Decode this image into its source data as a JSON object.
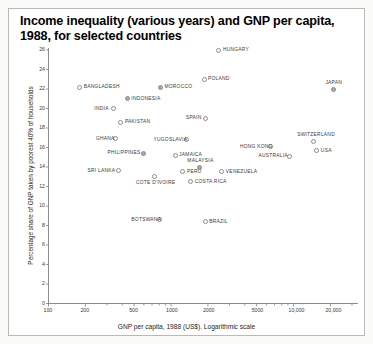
{
  "chart_data": {
    "type": "scatter",
    "title": "Income inequality (various years) and GNP per capita, 1988, for selected countries",
    "xlabel": "GNP per capita, 1988 (US$). Logarithmic scale",
    "ylabel": "Percentage share of GNP taken by poorest 40% of households",
    "xscale": "log",
    "xlim": [
      100,
      30000
    ],
    "ylim": [
      0,
      26
    ],
    "grid": false,
    "legend": "none",
    "xticks": [
      100,
      200,
      500,
      1000,
      2000,
      5000,
      10000,
      20000
    ],
    "xtick_labels": [
      "100",
      "200",
      "500",
      "1000",
      "2000",
      "5000",
      "10,000",
      "20,000"
    ],
    "yticks": [
      0,
      2,
      4,
      6,
      8,
      10,
      12,
      14,
      16,
      18,
      20,
      22,
      24,
      26
    ],
    "ytick_labels": [
      "0",
      "2",
      "4",
      "6",
      "8",
      "10",
      "12",
      "14",
      "16",
      "18",
      "20",
      "22",
      "24",
      "26"
    ],
    "points": [
      {
        "name": "HUNGARY",
        "x": 2460,
        "y": 26.0,
        "marker": "open",
        "label_side": "right"
      },
      {
        "name": "POLAND",
        "x": 1860,
        "y": 23.0,
        "marker": "open",
        "label_side": "right"
      },
      {
        "name": "BANGLADESH",
        "x": 180,
        "y": 22.2,
        "marker": "open",
        "label_side": "right"
      },
      {
        "name": "MOROCCO",
        "x": 820,
        "y": 22.2,
        "marker": "filled",
        "label_side": "right"
      },
      {
        "name": "JAPAN",
        "x": 21000,
        "y": 21.9,
        "marker": "filled",
        "label_side": "above"
      },
      {
        "name": "INDONESIA",
        "x": 440,
        "y": 21.0,
        "marker": "filled",
        "label_side": "right"
      },
      {
        "name": "INDIA",
        "x": 340,
        "y": 20.0,
        "marker": "open",
        "label_side": "left"
      },
      {
        "name": "SPAIN",
        "x": 1900,
        "y": 19.0,
        "marker": "open",
        "label_side": "left"
      },
      {
        "name": "PAKISTAN",
        "x": 390,
        "y": 18.6,
        "marker": "open",
        "label_side": "right"
      },
      {
        "name": "GHANA",
        "x": 350,
        "y": 16.9,
        "marker": "open",
        "label_side": "left"
      },
      {
        "name": "YUGOSLAVIA",
        "x": 1350,
        "y": 16.8,
        "marker": "open",
        "label_side": "left"
      },
      {
        "name": "SWITZERLAND",
        "x": 14500,
        "y": 16.6,
        "marker": "open",
        "label_side": "above"
      },
      {
        "name": "HONG KONG",
        "x": 6500,
        "y": 16.1,
        "marker": "open",
        "label_side": "left"
      },
      {
        "name": "USA",
        "x": 15500,
        "y": 15.7,
        "marker": "open",
        "label_side": "right"
      },
      {
        "name": "PHILIPPINES",
        "x": 600,
        "y": 15.4,
        "marker": "filled",
        "label_side": "left"
      },
      {
        "name": "JAMAICA",
        "x": 1080,
        "y": 15.2,
        "marker": "open",
        "label_side": "right"
      },
      {
        "name": "AUSTRALIA",
        "x": 9200,
        "y": 15.1,
        "marker": "open",
        "label_side": "left"
      },
      {
        "name": "MALAYSIA",
        "x": 1700,
        "y": 13.9,
        "marker": "filled",
        "label_side": "above"
      },
      {
        "name": "SRI LANKA",
        "x": 370,
        "y": 13.6,
        "marker": "open",
        "label_side": "left"
      },
      {
        "name": "PERU",
        "x": 1250,
        "y": 13.5,
        "marker": "open",
        "label_side": "right"
      },
      {
        "name": "VENEZUELA",
        "x": 2600,
        "y": 13.5,
        "marker": "open",
        "label_side": "right"
      },
      {
        "name": "COTE D'IVOIRE",
        "x": 740,
        "y": 13.0,
        "marker": "open",
        "label_side": "below"
      },
      {
        "name": "COSTA RICA",
        "x": 1450,
        "y": 12.5,
        "marker": "open",
        "label_side": "right"
      },
      {
        "name": "BOTSWANA",
        "x": 800,
        "y": 8.6,
        "marker": "open",
        "label_side": "left"
      },
      {
        "name": "BRAZIL",
        "x": 1900,
        "y": 8.4,
        "marker": "open",
        "label_side": "right"
      }
    ]
  }
}
